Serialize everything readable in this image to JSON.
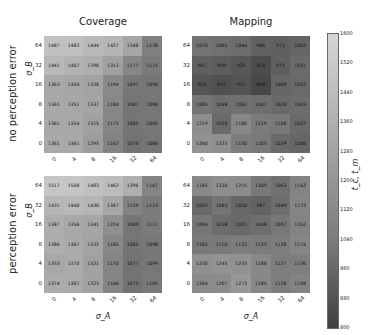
{
  "chart_data": {
    "type": "heatmap",
    "title": "",
    "column_titles": [
      "Coverage",
      "Mapping"
    ],
    "row_titles": [
      "no perception error",
      "perception error"
    ],
    "xlabel": "σ_A",
    "ylabel": "σ_B",
    "x_ticks": [
      "0",
      "4",
      "8",
      "16",
      "32",
      "64"
    ],
    "y_ticks_top_to_bottom": [
      "64",
      "32",
      "16",
      "8",
      "4",
      "0"
    ],
    "colorbar": {
      "label": "t_c, t_m",
      "ticks": [
        "1600",
        "1520",
        "1440",
        "1360",
        "1280",
        "1200",
        "1120",
        "1040",
        "960",
        "880",
        "800"
      ],
      "range": [
        800,
        1600
      ]
    },
    "panels": [
      {
        "name": "Coverage / no perception error",
        "rows": [
          [
            "1487",
            "1483",
            "1444",
            "1427",
            "1348",
            "1138"
          ],
          [
            "1441",
            "1407",
            "1390",
            "1313",
            "1177",
            "1115"
          ],
          [
            "1363",
            "1350",
            "1328",
            "1194",
            "1097",
            "1094"
          ],
          [
            "1361",
            "1351",
            "1337",
            "1180",
            "1087",
            "1090"
          ],
          [
            "1361",
            "1354",
            "1315",
            "1175",
            "1085",
            "1095"
          ],
          [
            "1361",
            "1361",
            "1295",
            "1162",
            "1076",
            "1084"
          ]
        ]
      },
      {
        "name": "Mapping / no perception error",
        "rows": [
          [
            "1076",
            "1065",
            "1044",
            "986",
            "973",
            "1003"
          ],
          [
            "967",
            "959",
            "925",
            "876",
            "971",
            "1031"
          ],
          [
            "914",
            "892",
            "911",
            "846",
            "1009",
            "1022"
          ],
          [
            "1085",
            "1048",
            "1062",
            "1047",
            "1028",
            "1043"
          ],
          [
            "1219",
            "1028",
            "1180",
            "1119",
            "1108",
            "1027"
          ],
          [
            "1240",
            "1223",
            "1130",
            "1105",
            "1029",
            "1006"
          ]
        ]
      },
      {
        "name": "Coverage / perception error",
        "rows": [
          [
            "1517",
            "1508",
            "1483",
            "1462",
            "1396",
            "1167"
          ],
          [
            "1431",
            "1440",
            "1430",
            "1347",
            "1159",
            "1113"
          ],
          [
            "1387",
            "1356",
            "1341",
            "1224",
            "1089",
            "1117"
          ],
          [
            "1386",
            "1367",
            "1332",
            "1185",
            "1085",
            "1098"
          ],
          [
            "1353",
            "1370",
            "1321",
            "1170",
            "1077",
            "1099"
          ],
          [
            "1374",
            "1367",
            "1323",
            "1166",
            "1075",
            "1105"
          ]
        ]
      },
      {
        "name": "Mapping / perception error",
        "rows": [
          [
            "1185",
            "1220",
            "1215",
            "1109",
            "1063",
            "1162"
          ],
          [
            "1025",
            "1083",
            "1010",
            "987",
            "1049",
            "1173"
          ],
          [
            "1094",
            "1038",
            "1021",
            "1048",
            "1097",
            "1162"
          ],
          [
            "1105",
            "1110",
            "1122",
            "1123",
            "1128",
            "1174"
          ],
          [
            "1230",
            "1245",
            "1233",
            "1188",
            "1127",
            "1136"
          ],
          [
            "1204",
            "1207",
            "1273",
            "1185",
            "1128",
            "1158"
          ]
        ]
      }
    ]
  }
}
